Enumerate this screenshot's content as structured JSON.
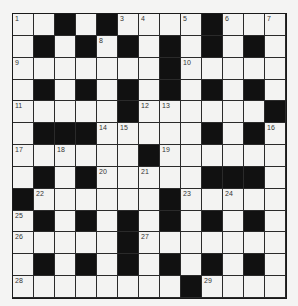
{
  "puzzle": {
    "rows": 13,
    "cols": 13,
    "colors": {
      "background": "#f4f4f3",
      "cell": "#f3f3f2",
      "block": "#111111",
      "grid_line": "#2a2a2a"
    },
    "grid": [
      "..#.X....#...",
      ".X.X.X.X.X.X.",
      ".......X.....",
      ".X.X.X.X.X.X.",
      ".....X......X",
      ".XXX.....X.X.",
      "......X......",
      ".X.X.....XXX.",
      "X......X.....",
      ".X.X.X.X.X.X.",
      ".....X.......",
      ".X.X.X.X.X.X.",
      "........X...."
    ],
    "numbers": [
      {
        "r": 0,
        "c": 0,
        "n": "1"
      },
      {
        "r": 0,
        "c": 2,
        "n": "2"
      },
      {
        "r": 0,
        "c": 5,
        "n": "3"
      },
      {
        "r": 0,
        "c": 6,
        "n": "4"
      },
      {
        "r": 0,
        "c": 8,
        "n": "5"
      },
      {
        "r": 0,
        "c": 10,
        "n": "6"
      },
      {
        "r": 0,
        "c": 12,
        "n": "7"
      },
      {
        "r": 1,
        "c": 4,
        "n": "8"
      },
      {
        "r": 2,
        "c": 0,
        "n": "9"
      },
      {
        "r": 2,
        "c": 8,
        "n": "10"
      },
      {
        "r": 4,
        "c": 0,
        "n": "11"
      },
      {
        "r": 4,
        "c": 6,
        "n": "12"
      },
      {
        "r": 4,
        "c": 7,
        "n": "13"
      },
      {
        "r": 5,
        "c": 4,
        "n": "14"
      },
      {
        "r": 5,
        "c": 5,
        "n": "15"
      },
      {
        "r": 5,
        "c": 12,
        "n": "16"
      },
      {
        "r": 6,
        "c": 0,
        "n": "17"
      },
      {
        "r": 6,
        "c": 2,
        "n": "18"
      },
      {
        "r": 6,
        "c": 7,
        "n": "19"
      },
      {
        "r": 7,
        "c": 4,
        "n": "20"
      },
      {
        "r": 7,
        "c": 6,
        "n": "21"
      },
      {
        "r": 8,
        "c": 1,
        "n": "22"
      },
      {
        "r": 8,
        "c": 8,
        "n": "23"
      },
      {
        "r": 8,
        "c": 10,
        "n": "24"
      },
      {
        "r": 9,
        "c": 0,
        "n": "25"
      },
      {
        "r": 10,
        "c": 0,
        "n": "26"
      },
      {
        "r": 10,
        "c": 6,
        "n": "27"
      },
      {
        "r": 12,
        "c": 0,
        "n": "28"
      },
      {
        "r": 12,
        "c": 9,
        "n": "29"
      }
    ],
    "entries": {}
  }
}
